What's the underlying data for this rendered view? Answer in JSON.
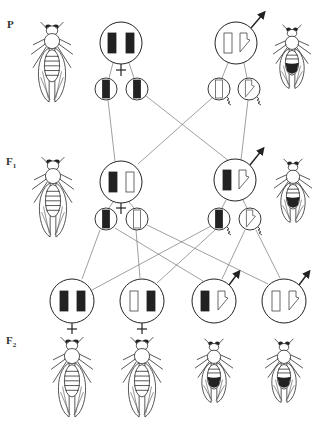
{
  "diagram": {
    "type": "genetic-cross-inheritance",
    "colors": {
      "line": "#555555",
      "stroke": "#222222",
      "fill_dark": "#222222",
      "background": "#ffffff"
    },
    "generations": [
      {
        "id": "P",
        "label": "P",
        "sub": ""
      },
      {
        "id": "F1",
        "label": "F",
        "sub": "1"
      },
      {
        "id": "F2",
        "label": "F",
        "sub": "2"
      }
    ],
    "parents": {
      "P": [
        {
          "sex": "female",
          "chromosomes": [
            "dark",
            "dark"
          ],
          "gametes": [
            "dark",
            "dark"
          ]
        },
        {
          "sex": "male",
          "chromosomes": [
            "light",
            "light-hook"
          ],
          "gametes": [
            "light",
            "light-hook"
          ]
        }
      ],
      "F1": [
        {
          "sex": "female",
          "chromosomes": [
            "dark",
            "light"
          ],
          "gametes": [
            "dark",
            "light"
          ]
        },
        {
          "sex": "male",
          "chromosomes": [
            "dark",
            "light-hook"
          ],
          "gametes": [
            "dark",
            "light-hook"
          ]
        }
      ]
    },
    "offspring_F2": [
      {
        "sex": "female",
        "chromosomes": [
          "dark",
          "dark"
        ]
      },
      {
        "sex": "female",
        "chromosomes": [
          "light",
          "dark"
        ]
      },
      {
        "sex": "male",
        "chromosomes": [
          "dark",
          "light-hook"
        ]
      },
      {
        "sex": "male",
        "chromosomes": [
          "light",
          "light-hook"
        ]
      }
    ],
    "symbols": {
      "female": "venus-symbol",
      "male": "mars-symbol",
      "sperm": "sperm-tail"
    }
  }
}
